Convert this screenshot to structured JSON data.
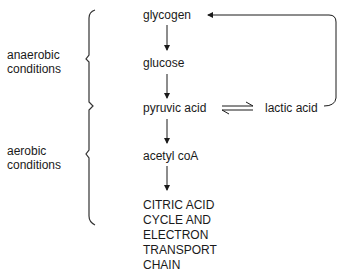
{
  "diagram": {
    "nodes": {
      "glycogen": "glycogen",
      "glucose": "glucose",
      "pyruvic_acid": "pyruvic acid",
      "lactic_acid": "lactic acid",
      "acetyl_coa": "acetyl coA",
      "final_stage": [
        "CITRIC ACID",
        "CYCLE AND",
        "ELECTRON",
        "TRANSPORT",
        "CHAIN"
      ]
    },
    "conditions": {
      "anaerobic": [
        "anaerobic",
        "conditions"
      ],
      "aerobic": [
        "aerobic",
        "conditions"
      ]
    },
    "edges": [
      {
        "from": "glycogen",
        "to": "glucose",
        "type": "arrow"
      },
      {
        "from": "glucose",
        "to": "pyruvic_acid",
        "type": "arrow"
      },
      {
        "from": "pyruvic_acid",
        "to": "lactic_acid",
        "type": "equilibrium"
      },
      {
        "from": "lactic_acid",
        "to": "glycogen",
        "type": "return-arrow"
      },
      {
        "from": "pyruvic_acid",
        "to": "acetyl_coa",
        "type": "arrow"
      },
      {
        "from": "acetyl_coa",
        "to": "final_stage",
        "type": "arrow"
      }
    ]
  }
}
